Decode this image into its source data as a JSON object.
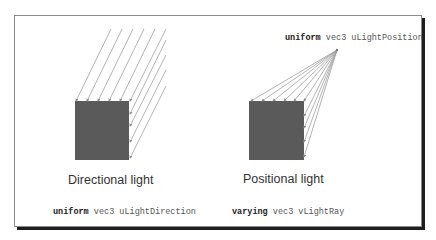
{
  "diagram": {
    "left_panel": {
      "caption": "Directional light",
      "code": {
        "qualifier": "uniform",
        "type": "vec3",
        "name": "uLightDirection"
      }
    },
    "right_panel": {
      "caption": "Positional light",
      "top_code": {
        "qualifier": "uniform",
        "type": "vec3",
        "name": "uLightPosition"
      },
      "bottom_code": {
        "qualifier": "varying",
        "type": "vec3",
        "name": "vLightRay"
      }
    },
    "colors": {
      "square_fill": "#5a5a5a",
      "ray_color": "#9a9a9a",
      "border": "#8a8a8a",
      "shadow": "#1e1e1e"
    }
  }
}
